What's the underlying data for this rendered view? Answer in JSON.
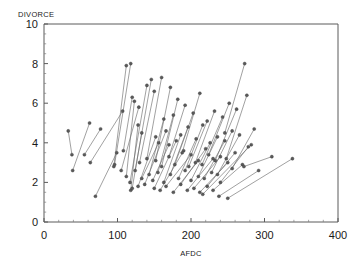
{
  "chart_data": {
    "type": "scatter",
    "title": "",
    "xlabel": "AFDC",
    "ylabel": "DIVORCE",
    "xlim": [
      0,
      400
    ],
    "ylim": [
      0,
      10
    ],
    "xticks": [
      0,
      100,
      200,
      300,
      400
    ],
    "yticks": [
      0,
      2,
      4,
      6,
      8,
      10
    ],
    "xtick_labels": [
      "0",
      "100",
      "200",
      "300",
      "400"
    ],
    "ytick_labels": [
      "0",
      "2",
      "4",
      "6",
      "8",
      "10"
    ],
    "grid": false,
    "legend": null,
    "minor_ticks": true,
    "marker": "circle",
    "series": [
      {
        "name": "paired-observations",
        "pairs": [
          {
            "x1": 33,
            "y1": 4.6,
            "x2": 38,
            "y2": 3.4
          },
          {
            "x1": 39,
            "y1": 2.6,
            "x2": 62,
            "y2": 5.0
          },
          {
            "x1": 55,
            "y1": 3.4,
            "x2": 77,
            "y2": 4.7
          },
          {
            "x1": 70,
            "y1": 1.3,
            "x2": 99,
            "y2": 3.5
          },
          {
            "x1": 63,
            "y1": 3.0,
            "x2": 107,
            "y2": 5.6
          },
          {
            "x1": 95,
            "y1": 2.8,
            "x2": 112,
            "y2": 7.9
          },
          {
            "x1": 96,
            "y1": 2.9,
            "x2": 118,
            "y2": 8.0
          },
          {
            "x1": 108,
            "y1": 3.6,
            "x2": 120,
            "y2": 6.3
          },
          {
            "x1": 112,
            "y1": 2.3,
            "x2": 123,
            "y2": 6.1
          },
          {
            "x1": 105,
            "y1": 2.6,
            "x2": 129,
            "y2": 5.8
          },
          {
            "x1": 118,
            "y1": 1.6,
            "x2": 128,
            "y2": 4.9
          },
          {
            "x1": 120,
            "y1": 1.7,
            "x2": 133,
            "y2": 4.5
          },
          {
            "x1": 117,
            "y1": 2.0,
            "x2": 140,
            "y2": 6.9
          },
          {
            "x1": 124,
            "y1": 2.6,
            "x2": 146,
            "y2": 7.2
          },
          {
            "x1": 130,
            "y1": 3.0,
            "x2": 150,
            "y2": 6.6
          },
          {
            "x1": 128,
            "y1": 1.8,
            "x2": 152,
            "y2": 4.3
          },
          {
            "x1": 133,
            "y1": 2.2,
            "x2": 156,
            "y2": 4.0
          },
          {
            "x1": 140,
            "y1": 3.2,
            "x2": 160,
            "y2": 7.3
          },
          {
            "x1": 143,
            "y1": 2.4,
            "x2": 163,
            "y2": 5.2
          },
          {
            "x1": 137,
            "y1": 1.9,
            "x2": 166,
            "y2": 4.6
          },
          {
            "x1": 148,
            "y1": 2.1,
            "x2": 170,
            "y2": 3.9
          },
          {
            "x1": 152,
            "y1": 3.1,
            "x2": 172,
            "y2": 6.8
          },
          {
            "x1": 155,
            "y1": 2.5,
            "x2": 176,
            "y2": 5.4
          },
          {
            "x1": 150,
            "y1": 1.7,
            "x2": 180,
            "y2": 4.1
          },
          {
            "x1": 160,
            "y1": 2.8,
            "x2": 182,
            "y2": 6.2
          },
          {
            "x1": 163,
            "y1": 2.0,
            "x2": 186,
            "y2": 4.4
          },
          {
            "x1": 158,
            "y1": 1.6,
            "x2": 190,
            "y2": 3.6
          },
          {
            "x1": 170,
            "y1": 3.3,
            "x2": 192,
            "y2": 5.9
          },
          {
            "x1": 172,
            "y1": 2.4,
            "x2": 196,
            "y2": 4.8
          },
          {
            "x1": 166,
            "y1": 1.8,
            "x2": 200,
            "y2": 3.4
          },
          {
            "x1": 178,
            "y1": 2.9,
            "x2": 203,
            "y2": 5.5
          },
          {
            "x1": 183,
            "y1": 2.2,
            "x2": 207,
            "y2": 4.2
          },
          {
            "x1": 176,
            "y1": 1.5,
            "x2": 210,
            "y2": 3.1
          },
          {
            "x1": 188,
            "y1": 3.5,
            "x2": 212,
            "y2": 6.5
          },
          {
            "x1": 192,
            "y1": 2.6,
            "x2": 216,
            "y2": 4.9
          },
          {
            "x1": 186,
            "y1": 1.9,
            "x2": 220,
            "y2": 3.7
          },
          {
            "x1": 197,
            "y1": 2.8,
            "x2": 222,
            "y2": 5.1
          },
          {
            "x1": 200,
            "y1": 2.1,
            "x2": 226,
            "y2": 4.0
          },
          {
            "x1": 195,
            "y1": 1.6,
            "x2": 230,
            "y2": 3.2
          },
          {
            "x1": 206,
            "y1": 3.0,
            "x2": 232,
            "y2": 5.6
          },
          {
            "x1": 210,
            "y1": 2.3,
            "x2": 236,
            "y2": 4.3
          },
          {
            "x1": 204,
            "y1": 1.7,
            "x2": 240,
            "y2": 3.3
          },
          {
            "x1": 215,
            "y1": 2.9,
            "x2": 243,
            "y2": 5.3
          },
          {
            "x1": 218,
            "y1": 2.2,
            "x2": 246,
            "y2": 4.1
          },
          {
            "x1": 212,
            "y1": 1.5,
            "x2": 250,
            "y2": 3.0
          },
          {
            "x1": 224,
            "y1": 3.4,
            "x2": 252,
            "y2": 6.0
          },
          {
            "x1": 228,
            "y1": 2.5,
            "x2": 256,
            "y2": 4.6
          },
          {
            "x1": 222,
            "y1": 1.8,
            "x2": 260,
            "y2": 3.5
          },
          {
            "x1": 233,
            "y1": 3.1,
            "x2": 262,
            "y2": 5.7
          },
          {
            "x1": 236,
            "y1": 2.4,
            "x2": 266,
            "y2": 4.4
          },
          {
            "x1": 230,
            "y1": 1.6,
            "x2": 270,
            "y2": 2.9
          },
          {
            "x1": 246,
            "y1": 4.5,
            "x2": 273,
            "y2": 8.0
          },
          {
            "x1": 248,
            "y1": 3.2,
            "x2": 276,
            "y2": 6.4
          },
          {
            "x1": 240,
            "y1": 2.0,
            "x2": 278,
            "y2": 3.8
          },
          {
            "x1": 216,
            "y1": 1.4,
            "x2": 282,
            "y2": 3.9
          },
          {
            "x1": 256,
            "y1": 2.7,
            "x2": 286,
            "y2": 4.7
          },
          {
            "x1": 238,
            "y1": 1.3,
            "x2": 292,
            "y2": 2.6
          },
          {
            "x1": 272,
            "y1": 2.8,
            "x2": 310,
            "y2": 3.3
          },
          {
            "x1": 250,
            "y1": 1.2,
            "x2": 338,
            "y2": 3.2
          }
        ]
      }
    ]
  },
  "axes": {
    "y_title": "DIVORCE",
    "x_title": "AFDC"
  }
}
